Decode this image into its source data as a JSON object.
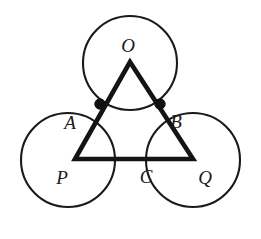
{
  "figure": {
    "width": 261,
    "height": 239,
    "background_color": "#ffffff",
    "stroke_color": "#1a1a1a",
    "triangle_color": "#141414",
    "dot_color": "#111111"
  },
  "circles": [
    {
      "id": "O",
      "label": "O",
      "cx": 130,
      "cy": 63,
      "r": 47,
      "name": "circle-o-top"
    },
    {
      "id": "P",
      "label": "P",
      "cx": 68,
      "cy": 160,
      "r": 47,
      "name": "circle-p-bottom-left"
    },
    {
      "id": "Q",
      "label": "Q",
      "cx": 193,
      "cy": 160,
      "r": 47,
      "name": "circle-q-bottom-right"
    }
  ],
  "triangle": {
    "label": "triangle",
    "vertices": [
      {
        "id": "apex",
        "x": 130,
        "y": 62
      },
      {
        "id": "bottom-left",
        "x": 75,
        "y": 159
      },
      {
        "id": "bottom-right",
        "x": 193,
        "y": 159
      }
    ],
    "stroke_width": 4.6,
    "closed": true
  },
  "marked_points": [
    {
      "id": "A",
      "label": "A",
      "x": 100,
      "y": 104,
      "radius": 5.2
    },
    {
      "id": "B",
      "label": "B",
      "x": 160,
      "y": 104,
      "radius": 5.2
    }
  ],
  "labels": [
    {
      "id": "label-O",
      "text": "O",
      "x": 128,
      "y": 45
    },
    {
      "id": "label-A",
      "text": "A",
      "x": 70,
      "y": 122
    },
    {
      "id": "label-B",
      "text": "B",
      "x": 176,
      "y": 121
    },
    {
      "id": "label-P",
      "text": "P",
      "x": 62,
      "y": 177
    },
    {
      "id": "label-C",
      "text": "C",
      "x": 146,
      "y": 176
    },
    {
      "id": "label-Q",
      "text": "Q",
      "x": 205,
      "y": 177
    }
  ]
}
